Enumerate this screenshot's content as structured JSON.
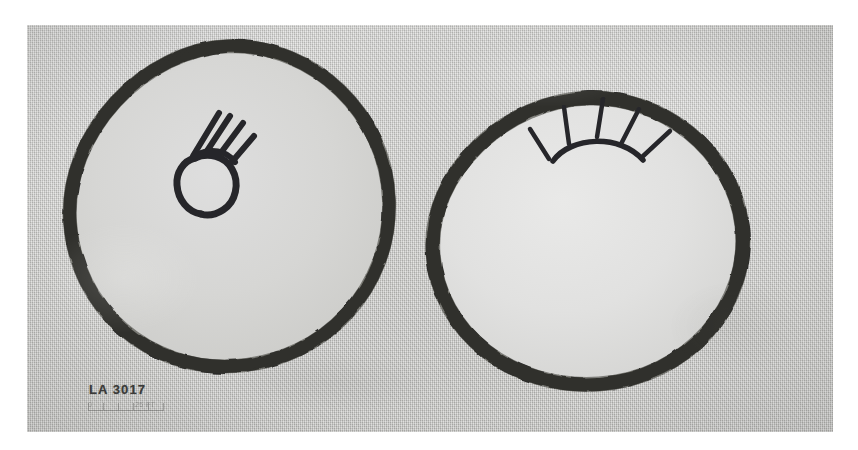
{
  "plate": {
    "caption_label": "LA 3017",
    "background_color": "#ffffff",
    "print_tone": "#c9c9c7",
    "ink_color": "#2b2b29"
  },
  "scale_bar": {
    "start_label": "0",
    "end_label": "25 FT",
    "tick_count": 6
  },
  "figures": [
    {
      "id": "left-ring",
      "name": "left-circular-design",
      "shape": "irregular hand-drawn circle, heavy dark outline, light interior",
      "motif": {
        "name": "hand-motif",
        "description": "open ring palm with four radiating finger strokes angled up and to the right",
        "finger_count": 4
      }
    },
    {
      "id": "right-ring",
      "name": "right-circular-design",
      "shape": "irregular circle flattened across the top, heavy dark outline, light interior",
      "motif": {
        "name": "sunburst-motif",
        "description": "low arc with five rays radiating upward",
        "ray_count": 5
      }
    }
  ]
}
